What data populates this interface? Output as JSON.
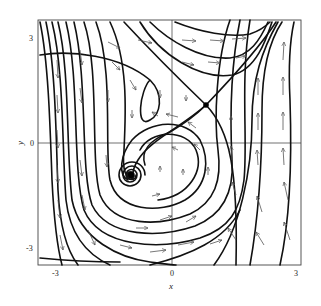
{
  "figure": {
    "type": "phase-portrait",
    "x_axis": {
      "label": "x",
      "ticks": [
        "-3",
        "0",
        "3"
      ]
    },
    "y_axis": {
      "label": "y",
      "ticks": [
        "-3",
        "0",
        "3"
      ]
    },
    "range": {
      "x": [
        -3.4,
        3.2
      ],
      "y": [
        -3.5,
        3.5
      ]
    },
    "fixed_points": [
      {
        "kind": "stable-spiral",
        "x": -1.0,
        "y": -0.9
      },
      {
        "kind": "saddle",
        "x": 0.85,
        "y": 1.1
      }
    ]
  },
  "colors": {
    "stroke": "#111111",
    "arrow": "#555555",
    "frame": "#444444",
    "background": "#ffffff"
  }
}
